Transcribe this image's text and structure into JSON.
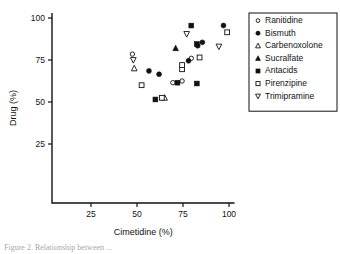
{
  "chart_data": {
    "type": "scatter",
    "title": "",
    "xlabel": "Cimetidine (%)",
    "ylabel": "Drug (%)",
    "xlim": [
      0,
      105
    ],
    "ylim": [
      0,
      103
    ],
    "xticks": [
      25,
      50,
      75,
      100
    ],
    "yticks": [
      25,
      50,
      75,
      100
    ],
    "grid": false,
    "legend_position": "top-right",
    "series": [
      {
        "name": "Ranitidine",
        "marker": "open-circle",
        "color": "#111111",
        "points": [
          {
            "x": 47.5,
            "y": 78.5
          },
          {
            "x": 69.5,
            "y": 61.5
          },
          {
            "x": 79.5,
            "y": 76.0
          },
          {
            "x": 74.5,
            "y": 62.5
          }
        ]
      },
      {
        "name": "Bismuth",
        "marker": "filled-circle",
        "color": "#111111",
        "points": [
          {
            "x": 56.5,
            "y": 68.5
          },
          {
            "x": 62.0,
            "y": 66.5
          },
          {
            "x": 78.0,
            "y": 74.5
          },
          {
            "x": 83.0,
            "y": 83.5
          },
          {
            "x": 85.5,
            "y": 85.5
          },
          {
            "x": 97.0,
            "y": 95.5
          }
        ]
      },
      {
        "name": "Carbenoxolone",
        "marker": "open-triangle-up",
        "color": "#111111",
        "points": [
          {
            "x": 48.5,
            "y": 70.0
          },
          {
            "x": 65.0,
            "y": 52.5
          }
        ]
      },
      {
        "name": "Sucralfate",
        "marker": "filled-triangle-up",
        "color": "#111111",
        "points": [
          {
            "x": 71.0,
            "y": 82.0
          }
        ]
      },
      {
        "name": "Antacids",
        "marker": "filled-square",
        "color": "#111111",
        "points": [
          {
            "x": 60.0,
            "y": 51.5
          },
          {
            "x": 72.0,
            "y": 61.5
          },
          {
            "x": 79.5,
            "y": 95.5
          },
          {
            "x": 82.5,
            "y": 84.5
          },
          {
            "x": 82.5,
            "y": 61.0
          }
        ]
      },
      {
        "name": "Pirenzipine",
        "marker": "open-square",
        "color": "#111111",
        "points": [
          {
            "x": 52.5,
            "y": 60.0
          },
          {
            "x": 63.5,
            "y": 52.5
          },
          {
            "x": 74.5,
            "y": 69.5
          },
          {
            "x": 74.5,
            "y": 72.0
          },
          {
            "x": 84.0,
            "y": 76.5
          },
          {
            "x": 99.0,
            "y": 91.5
          }
        ]
      },
      {
        "name": "Trimipramine",
        "marker": "open-triangle-down",
        "color": "#111111",
        "points": [
          {
            "x": 48.0,
            "y": 75.0
          },
          {
            "x": 77.0,
            "y": 90.5
          },
          {
            "x": 94.5,
            "y": 83.0
          }
        ]
      }
    ]
  },
  "legend": {
    "entries": [
      {
        "label": "Ranitidine",
        "marker": "open-circle"
      },
      {
        "label": "Bismuth",
        "marker": "filled-circle"
      },
      {
        "label": "Carbenoxolone",
        "marker": "open-triangle-up"
      },
      {
        "label": "Sucralfate",
        "marker": "filled-triangle-up"
      },
      {
        "label": "Antacids",
        "marker": "filled-square"
      },
      {
        "label": "Pirenzipine",
        "marker": "open-square"
      },
      {
        "label": "Trimipramine",
        "marker": "open-triangle-down"
      }
    ]
  },
  "caption": {
    "text": "Figure 2.  Relationship between ..."
  }
}
